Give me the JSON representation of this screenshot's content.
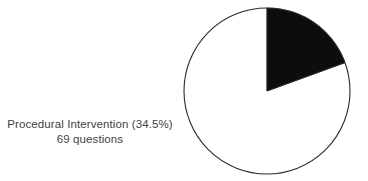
{
  "figure": {
    "background_color": "#ffffff",
    "type": "pie-chart-figure"
  },
  "label": {
    "line1": "Procedural Intervention (34.5%)",
    "line2": "69 questions",
    "text_color": "#3f3f3f"
  },
  "pie": {
    "outline_color": "#2b2b2b",
    "highlight_color": "#0d0d0d",
    "remainder_color": "#ffffff",
    "center_x": 267,
    "center_y": 91,
    "radius": 83
  },
  "chart_data": {
    "type": "pie",
    "title": "",
    "categories": [
      "Procedural Intervention",
      "Other"
    ],
    "values": [
      34.5,
      65.5
    ],
    "counts": [
      69,
      null
    ],
    "labels": [
      "Procedural Intervention (34.5%)",
      ""
    ],
    "annotations": [
      "Procedural Intervention (34.5%)",
      "69 questions"
    ],
    "colors": [
      "#0d0d0d",
      "#ffffff"
    ],
    "start_angle": 90,
    "direction": "clockwise",
    "legend": "none",
    "grid": false,
    "highlighted_slice_index": 0,
    "highlighted_slice_percent": 34.5,
    "highlighted_slice_count": 69,
    "highlighted_slice_sweep_degrees": 70
  }
}
